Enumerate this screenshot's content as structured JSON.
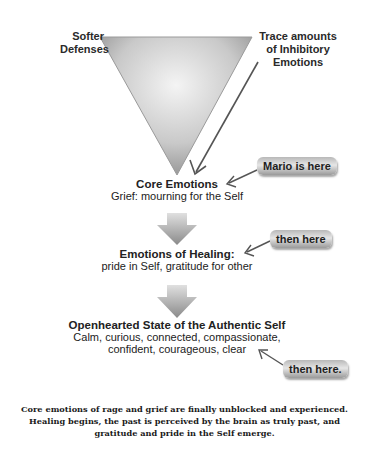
{
  "triangle": {
    "left_label": [
      "Softer",
      "Defenses"
    ],
    "right_label": [
      "Trace amounts",
      "of Inhibitory",
      "Emotions"
    ]
  },
  "stages": [
    {
      "title": "Core Emotions",
      "lines": [
        "Grief: mourning for the Self"
      ]
    },
    {
      "title": "Emotions of Healing:",
      "lines": [
        "pride in Self, gratitude for other"
      ]
    },
    {
      "title": "Openhearted State of the Authentic Self",
      "lines": [
        "Calm, curious, connected, compassionate,",
        "confident, courageous, clear"
      ]
    }
  ],
  "tags": [
    {
      "label": "Mario is here"
    },
    {
      "label": "then here"
    },
    {
      "label": "then here."
    }
  ],
  "caption": [
    "Core emotions of rage and grief are finally unblocked and experienced.",
    "Healing begins, the past is perceived by the brain as truly past, and",
    "gratitude and pride in the Self emerge."
  ],
  "colors": {
    "shape_dark": "#8a8a8a",
    "shape_light": "#f2f2f2",
    "arrow_line": "#555555"
  }
}
